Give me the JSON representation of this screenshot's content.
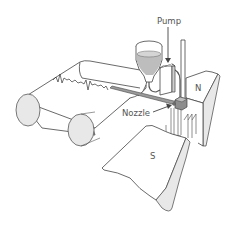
{
  "diagram": {
    "labels": {
      "pump": "Pump",
      "nozzle": "Nozzle",
      "north_pole": "N",
      "south_pole": "S"
    },
    "components": [
      "paper-chart-roll",
      "front-roller",
      "rear-roller",
      "ink-trace",
      "ink-reservoir",
      "pump",
      "ink-feed-tube",
      "nozzle",
      "galvanometer-coil",
      "north-magnet-pole",
      "south-magnet-pole",
      "support-rod"
    ],
    "colors": {
      "line": "#444444",
      "label": "#555555",
      "fill_grey": "#cfcfcf",
      "fill_light": "#e8e8e8",
      "background": "#ffffff"
    }
  }
}
